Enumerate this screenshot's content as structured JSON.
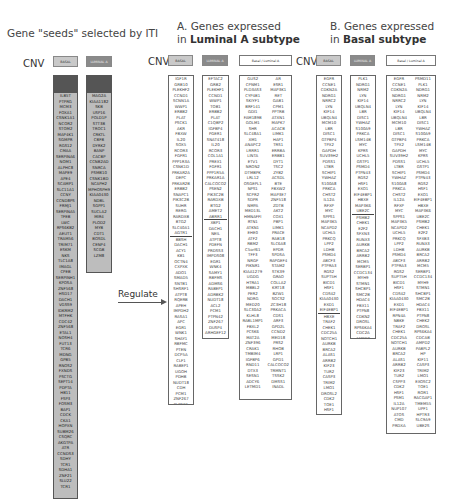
{
  "seeds_title": "Gene \"seeds\" selected by ITI",
  "panelA": {
    "title_prefix": "A. Genes expressed",
    "title_in": "in ",
    "title_bold": "Luminal A subtype"
  },
  "panelB": {
    "title_prefix": "B. Genes expressed",
    "title_in": "in ",
    "title_bold": "Basal subtype"
  },
  "cnv_label": "CNV",
  "tags": {
    "basal": "BASAL",
    "luminal": "LUMINAL A",
    "both": "Basal / Luminal A"
  },
  "regulate_label": "Regulate",
  "seeds": {
    "basal": [
      "ILB5T",
      "PTPRG",
      "MCM3",
      "FOXA1",
      "CSNK1A1",
      "NCOR2",
      "STOM2",
      "MAP4K1",
      "SGMPR",
      "RGS12",
      "CMAA",
      "SERPINA6",
      "NOM1",
      "ALPHC8",
      "MAPE9",
      "APE4",
      "SCAMP1",
      "SLC11A1",
      "CCNY",
      "CCND8PS",
      "FRMJ1",
      "SERPINA5",
      "TFEB",
      "LWC",
      "RPS6KB2",
      "AEUT1",
      "TRAM56",
      "TRIM71",
      "ESKM",
      "NKS",
      "TLC1A8",
      "IMAGL",
      "CPEB",
      "SERPINH1",
      "KPOSA",
      "ZNF568",
      "HSD17",
      "DACH1",
      "VGSS9",
      "IDKRM2",
      "MTFHK",
      "CDC42",
      "ZNF568",
      "ETAL1",
      "NOSH4",
      "FUT13",
      "TCR6",
      "MDNG",
      "GPB5",
      "RNOS2",
      "FXNDS",
      "PSCTG",
      "SEPT14",
      "PDPTA",
      "HB11",
      "FSP3",
      "FOSM3",
      "BAP1",
      "CDCK",
      "CKA1",
      "HOPXN",
      "SUBM26",
      "CSQRC",
      "AKGTPA",
      "ATR",
      "CCNDS3",
      "SDHY",
      "TCR1",
      "SDHA1",
      "ZNF21",
      "SLU22",
      "TCR1"
    ],
    "luminal": [
      "MAG2A",
      "KIAA1182",
      "SKB",
      "USP16",
      "POLD1P",
      "STT3B",
      "TROC1",
      "CRKTL",
      "CBFB",
      "DYRK2",
      "BANP",
      "CACBP",
      "CCNB2AD",
      "SNRCA",
      "PSMB10",
      "CSNK1BD",
      "NCAPH2",
      "MPHOSPH9",
      "KIAA0430",
      "NDBL",
      "SGPP1",
      "SUCLA2",
      "MIR4",
      "PLOD2",
      "MYB",
      "CDT1",
      "BOSDL",
      "CENP4",
      "SCGB",
      "LZM8"
    ]
  },
  "panelA_cols": {
    "basal": {
      "top": [
        "IGF1R",
        "GRB10",
        "PLEKHF2",
        "CCND1",
        "SCNN1A",
        "WWP1",
        "ERBB2",
        "PLAT",
        "PSCK1",
        "AKR",
        "FBXW",
        "IL20",
        "SOX5",
        "RCOR3",
        "FGFR1",
        "PPP1R3A",
        "CSNK1D",
        "PRKAR2A",
        "DEPC",
        "PRKAR2B",
        "ERBB2",
        "SNAPC1",
        "PIK3C2B",
        "SUHR",
        "RERG",
        "RARDXB",
        "BTG2",
        "SLC40A1",
        "AGTR1"
      ],
      "bottom": [
        "BBSH",
        "DACH1",
        "ACY1",
        "KB1",
        "OCTN4",
        "CXPXK",
        "ADO1",
        "SMAD5",
        "SNTB1",
        "SHSRF1",
        "ATPT8",
        "RQERB",
        "APEH",
        "IMPDH2",
        "RASA1",
        "APC",
        "EGR1",
        "WNK1",
        "SHAY1",
        "RBFMC",
        "PTEN",
        "DCP5A",
        "CLF1",
        "RABEP1",
        "UGOH",
        "PDHB",
        "NUDT18",
        "CDH",
        "PCM1",
        "ZNF267",
        "PLPNE1",
        "LMP1",
        "PGGT1B",
        "DUSP4",
        "SMAD3",
        "ARL3",
        "CDK1",
        "MTUS1"
      ]
    },
    "luminal": {
      "top": [
        "EFTAC2",
        "GRB2",
        "PLEKHF1",
        "CCND1",
        "WWP1",
        "TOB1",
        "ERBB2",
        "PLAT",
        "C1QBP2",
        "IGFBP4",
        "PGER1",
        "SNAT418",
        "IL20",
        "RCOR3",
        "COL1A1",
        "PREX1",
        "FGFR1",
        "PPP1R5A",
        "PRKAR1A",
        "CALCOCO2",
        "PSEN2",
        "PIK3C2B",
        "RARDXB",
        "BTG2",
        "AMET2",
        "ABRR1"
      ],
      "bottom": [
        "XBP1",
        "DACH1",
        "NEIL",
        "ATPT8",
        "PDEFN",
        "PRDSS3",
        "IMPDS08",
        "EGR1",
        "WNK4",
        "SAMY1",
        "RBFMS",
        "ADMS6",
        "RABEP1",
        "ADRBK2",
        "NUDT18",
        "ACL2",
        "PCM1",
        "PTPN42",
        "ZNF267",
        "DUSP4",
        "ARHGEF12"
      ]
    },
    "both": {
      "left": [
        "GUS2",
        "CPNM1",
        "PLD3AS3",
        "CYP4B1",
        "SKIYF1",
        "BRF141",
        "GDI1",
        "FAM189B",
        "GOLM1",
        "SHR",
        "SLC48A1",
        "XM1",
        "ANAPC2",
        "LRRR1",
        "LINTA",
        "ETV1",
        "NRON2",
        "DTMBPK",
        "LRL12",
        "OSGEPL1",
        "NPS1",
        "SCPR2",
        "SDPR",
        "NMPA",
        "MED13L",
        "HMNAFFI",
        "RTN1",
        "ATKN1",
        "EHE0",
        "ATF2",
        "RBM2",
        "C5orf61",
        "TFF3",
        "NRGF",
        "PIKNR1",
        "KIAA1279",
        "UGDG",
        "HTRA1",
        "MBBL2",
        "PER2",
        "NDRG",
        "MED20",
        "SLC30A2",
        "KLHL8",
        "RABL1MP1",
        "FBXL2",
        "PCSK6",
        "MAT2A",
        "ZNF396",
        "CRAK1",
        "TMBIM4",
        "IGFBP6",
        "RND11",
        "DTX3",
        "SESN1",
        "ADCY6",
        "LETMD1"
      ],
      "right": [
        "AR",
        "ESR1",
        "MAP3K1",
        "RET",
        "GAB1",
        "CPM1",
        "PPTRB",
        "ATXN1",
        "MAPK7",
        "ACACB",
        "LIMK1",
        "HAP1",
        "TRS1",
        "ERRBA",
        "ERBB1",
        "DYT1",
        "TSC2",
        "ZYB2",
        "ACSDL",
        "BTE",
        "FBXW2",
        "MAP3E7",
        "ZNF518",
        "ZDTB",
        "AKT2",
        "COX1",
        "PBP1",
        "LIMK1",
        "PRACE",
        "RAB18",
        "SLC6A8",
        "EPDR",
        "SPDSA",
        "RAPGEF4",
        "STAM2",
        "STK39",
        "GRAO",
        "COLLA2",
        "KRT18",
        "BZW1",
        "SOCS2",
        "ZC3H18",
        "PRKACA",
        "CDS1",
        "ARF3",
        "GPD2L",
        "CCND2",
        "MED18",
        "PRS2",
        "RHOB",
        "LRP1",
        "GPD1",
        "CALCOCO2",
        "TRMNT1",
        "TSSK2",
        "DMSS1",
        "INADL"
      ]
    }
  },
  "panelB_cols": {
    "basal": {
      "top": [
        "EGFR",
        "CCNE1",
        "CDKN2A",
        "NDRG1",
        "NRRC2",
        "LYN",
        "KIF14",
        "UBQLN4",
        "MCM10",
        "LBR",
        "DISC1",
        "GTPBP4",
        "TPX2",
        "GAPDH",
        "SUV39H2",
        "PDSS1",
        "LTBR",
        "SCHIP1",
        "YWHAZ",
        "S100A8",
        "PRKCA",
        "CHST2",
        "IL12A",
        "RFXP",
        "MYC",
        "SPPS1",
        "MAP3K5",
        "NCAPD2",
        "UCHL5",
        "PRKCQ",
        "LPP2",
        "LDHB",
        "PSMD4",
        "ABCF3",
        "PTPRA3",
        "RGS2",
        "SUPT5H",
        "BICD1",
        "HSF1",
        "CDS42",
        "KIAA0430",
        "EXD1",
        "EIF4EBP1"
      ],
      "bottom": [
        "HBXE",
        "TRAF2",
        "CHEK1",
        "CDC25A",
        "NOTCH1",
        "AURKB",
        "BRCA2",
        "ALAS1",
        "ARRB2",
        "KIF23",
        "TUR2",
        "CASP3",
        "TRIM2",
        "LMO1",
        "DROSL2",
        "CDK2",
        "TOE1",
        "HSF1",
        "ROR1",
        "PSM1"
      ]
    },
    "luminal": {
      "top": [
        "PLK1",
        "NDRG1",
        "NRM2",
        "LYN",
        "KIF14",
        "UBQLN4",
        "LBR",
        "DISC1",
        "YWHAZ",
        "S100A9",
        "PRKCA",
        "LSM14B",
        "MYC",
        "KPRS",
        "UCHL5",
        "GSTP1",
        "PSMD4",
        "PTPN43",
        "RGS2",
        "HSF1",
        "EXO1",
        "EIF4EBP1",
        "HBXE",
        "MAP3K6",
        "UBE2C"
      ],
      "bottom": [
        "PSMB2",
        "CHEK1",
        "E2F2",
        "SFXN3",
        "RUNX3",
        "AURKB",
        "BRCA2",
        "ARRB2",
        "MCM5",
        "SERBP1",
        "CCDC134",
        "MYH9",
        "STMN1",
        "SHCBP1",
        "SMC2B",
        "HDAC4",
        "FBX11",
        "PTPN8",
        "CDKN2",
        "DROSL",
        "RPS6KA4",
        "CDC2A",
        "AMPD2",
        "PABPL2",
        "HP"
      ]
    },
    "both": {
      "left": [
        "EGFR",
        "CCNE1",
        "CDKN2A",
        "NDRG1",
        "NRRC2",
        "LYN",
        "KIF14",
        "UBQLN4",
        "MCM10",
        "LBR",
        "DISC1",
        "GTPBP4",
        "TPX2",
        "GAPDH",
        "SUV39H2",
        "PDSS1",
        "LTBR",
        "SCHIP1",
        "YWHAZ",
        "S100A8",
        "PRKCA",
        "CHST2",
        "IL12A",
        "RFXP",
        "MYC",
        "SPPS1",
        "MAP3K5",
        "NCAPD2",
        "UCHL5",
        "PRKCQ",
        "LPP2",
        "LDHB",
        "PSMD4",
        "ABCF3",
        "PTPRA3",
        "RGS2",
        "SUPT5H",
        "BICD1",
        "HSF1",
        "CDS42",
        "KIAA0430",
        "EXD1",
        "EIF4EBP1",
        "RPN4A",
        "NBKE",
        "TRAF2",
        "CHEK1",
        "CDC25A",
        "NOTCH1",
        "AURKB",
        "BRCA2",
        "ALAS1",
        "ARRB2",
        "KIF23",
        "TUR2",
        "CSPP3",
        "CDK2",
        "HSF1",
        "PSM1",
        "IL12A",
        "NUP107",
        "ATOS",
        "CMD",
        "PRDXA"
      ],
      "right": [
        "PSMD11",
        "PLK1",
        "NDRG1",
        "NRM2",
        "LYN",
        "KIF14",
        "UBQLN4",
        "LBR",
        "DISC1",
        "YWHAZ",
        "S100A9",
        "PRKCA",
        "LSM14B",
        "MYC",
        "KPRS",
        "UCHL5",
        "GSTP1",
        "PSMD4",
        "PTPN43",
        "RGS2",
        "HSF1",
        "EXO1",
        "EIF4EBP1",
        "HBXE",
        "MAP3K6",
        "UBE2C",
        "PSMB2",
        "CHEK1",
        "E2F2",
        "SFXB3",
        "RUNX3",
        "AURKB",
        "BRCA2",
        "ARRB2",
        "MCM5",
        "SERBP1",
        "CCDC134",
        "MYH9",
        "STMN1",
        "SHCBP1",
        "SMC2B",
        "HDAC4",
        "FBX11",
        "PTPN8",
        "CHEK2",
        "DROSL",
        "RPS6KA4",
        "CDCAB",
        "AMPD2",
        "PABPL2",
        "HP",
        "KIF11",
        "CASP3",
        "TRIM2",
        "LMO1",
        "EXOSC2",
        "TOE1",
        "ROR1",
        "RACGAP1",
        "TMEM55",
        "UPF1",
        "HPTR3",
        "SLC9A9",
        "UBE2S"
      ]
    }
  }
}
